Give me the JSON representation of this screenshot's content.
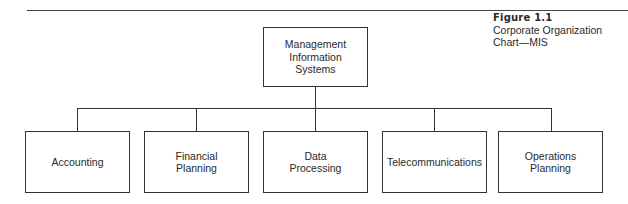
{
  "figure": {
    "number": "Figure 1.1",
    "title": "Corporate Organization Chart—MIS"
  },
  "chart": {
    "root": {
      "label": "Management\nInformation\nSystems"
    },
    "children": [
      {
        "label": "Accounting"
      },
      {
        "label": "Financial\nPlanning"
      },
      {
        "label": "Data\nProcessing"
      },
      {
        "label": "Telecommunications"
      },
      {
        "label": "Operations\nPlanning"
      }
    ]
  },
  "colors": {
    "line": "#333333",
    "text": "#2a2a2a",
    "background": "#ffffff"
  }
}
